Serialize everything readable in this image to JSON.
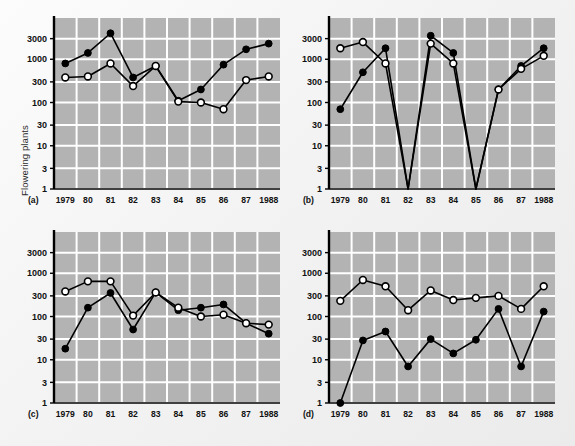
{
  "figure": {
    "ylabel": "Flowering plants",
    "background_color": "#f2f2f2",
    "plot_background_color": "#b3b3b3",
    "grid_color": "#ffffff",
    "axis_color": "#000000",
    "series_color": "#000000"
  },
  "chart_data": [
    {
      "type": "line",
      "panel": "(a)",
      "title": "",
      "xlabel": "",
      "ylabel": "Flowering plants",
      "x": [
        "1979",
        "80",
        "81",
        "82",
        "83",
        "84",
        "85",
        "86",
        "87",
        "1988"
      ],
      "xtick_labels": [
        "1979",
        "80",
        "81",
        "82",
        "83",
        "84",
        "85",
        "86",
        "87",
        "1988"
      ],
      "ytick_labels": [
        "1",
        "3",
        "10",
        "30",
        "100",
        "300",
        "1000",
        "3000"
      ],
      "ytick_values": [
        1,
        3,
        10,
        30,
        100,
        300,
        1000,
        3000
      ],
      "yscale": "log",
      "ylim": [
        1,
        9000
      ],
      "grid": true,
      "legend": "none",
      "series": [
        {
          "name": "filled-circles",
          "marker": "filled-circle",
          "values": [
            800,
            1400,
            4000,
            380,
            700,
            110,
            200,
            750,
            1700,
            2300
          ]
        },
        {
          "name": "open-circles",
          "marker": "open-circle",
          "values": [
            380,
            400,
            800,
            240,
            700,
            105,
            100,
            70,
            330,
            400
          ]
        }
      ]
    },
    {
      "type": "line",
      "panel": "(b)",
      "title": "",
      "xlabel": "",
      "ylabel": "",
      "x": [
        "1979",
        "80",
        "81",
        "82",
        "83",
        "84",
        "85",
        "86",
        "87",
        "1988"
      ],
      "xtick_labels": [
        "1979",
        "80",
        "81",
        "82",
        "83",
        "84",
        "85",
        "86",
        "87",
        "1988"
      ],
      "ytick_labels": [
        "1",
        "3",
        "10",
        "30",
        "100",
        "300",
        "1000",
        "3000"
      ],
      "ytick_values": [
        1,
        3,
        10,
        30,
        100,
        300,
        1000,
        3000
      ],
      "yscale": "log",
      "ylim": [
        1,
        9000
      ],
      "grid": true,
      "legend": "none",
      "series": [
        {
          "name": "filled-circles",
          "marker": "filled-circle",
          "values": [
            70,
            500,
            1800,
            0,
            3500,
            1400,
            0,
            200,
            700,
            1800
          ]
        },
        {
          "name": "open-circles",
          "marker": "open-circle",
          "values": [
            1800,
            2500,
            800,
            0,
            2300,
            800,
            0,
            200,
            600,
            1200
          ]
        }
      ]
    },
    {
      "type": "line",
      "panel": "(c)",
      "title": "",
      "xlabel": "",
      "ylabel": "",
      "x": [
        "1979",
        "80",
        "81",
        "82",
        "83",
        "84",
        "85",
        "86",
        "87",
        "1988"
      ],
      "xtick_labels": [
        "1979",
        "80",
        "81",
        "82",
        "83",
        "84",
        "85",
        "86",
        "87",
        "1988"
      ],
      "ytick_labels": [
        "1",
        "3",
        "10",
        "30",
        "100",
        "300",
        "1000",
        "3000"
      ],
      "ytick_values": [
        1,
        3,
        10,
        30,
        100,
        300,
        1000,
        3000
      ],
      "yscale": "log",
      "ylim": [
        1,
        9000
      ],
      "grid": true,
      "legend": "none",
      "series": [
        {
          "name": "filled-circles",
          "marker": "filled-circle",
          "values": [
            18,
            160,
            350,
            50,
            360,
            140,
            160,
            190,
            70,
            40
          ]
        },
        {
          "name": "open-circles",
          "marker": "open-circle",
          "values": [
            380,
            650,
            650,
            105,
            360,
            160,
            100,
            110,
            70,
            65
          ]
        }
      ]
    },
    {
      "type": "line",
      "panel": "(d)",
      "title": "",
      "xlabel": "",
      "ylabel": "",
      "x": [
        "1979",
        "80",
        "81",
        "82",
        "83",
        "84",
        "85",
        "86",
        "87",
        "1988"
      ],
      "xtick_labels": [
        "1979",
        "80",
        "81",
        "82",
        "83",
        "84",
        "85",
        "86",
        "87",
        "1988"
      ],
      "ytick_labels": [
        "1",
        "3",
        "10",
        "30",
        "100",
        "300",
        "1000",
        "3000"
      ],
      "ytick_values": [
        1,
        3,
        10,
        30,
        100,
        300,
        1000,
        3000
      ],
      "yscale": "log",
      "ylim": [
        1,
        9000
      ],
      "grid": true,
      "legend": "none",
      "series": [
        {
          "name": "filled-circles",
          "marker": "filled-circle",
          "values": [
            1,
            28,
            45,
            7,
            30,
            14,
            29,
            150,
            7,
            130
          ]
        },
        {
          "name": "open-circles",
          "marker": "open-circle",
          "values": [
            230,
            700,
            500,
            140,
            400,
            240,
            270,
            300,
            150,
            500
          ]
        }
      ]
    }
  ],
  "panels": [
    {
      "letter": "(a)",
      "left": 14,
      "top": 10,
      "width": 272,
      "height": 205,
      "show_yticks": true
    },
    {
      "letter": "(b)",
      "left": 289,
      "top": 10,
      "width": 272,
      "height": 205,
      "show_yticks": true
    },
    {
      "letter": "(c)",
      "left": 14,
      "top": 224,
      "width": 272,
      "height": 205,
      "show_yticks": true
    },
    {
      "letter": "(d)",
      "left": 289,
      "top": 224,
      "width": 272,
      "height": 205,
      "show_yticks": true
    }
  ]
}
